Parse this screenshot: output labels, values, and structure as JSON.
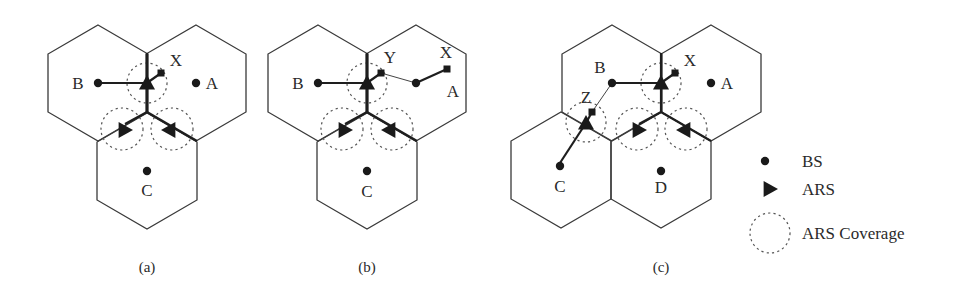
{
  "figure": {
    "panels": [
      {
        "id": "a",
        "caption": "(a)",
        "cells": [
          {
            "name": "B",
            "cx": 98,
            "cy": 83,
            "label_dx": -20,
            "label_dy": 6
          },
          {
            "name": "A",
            "cx": 196,
            "cy": 83,
            "label_dx": 16,
            "label_dy": 6
          },
          {
            "name": "C",
            "cx": 147,
            "cy": 171,
            "label_dx": 0,
            "label_dy": 25
          }
        ],
        "ars": [
          {
            "x": 147,
            "y": 83,
            "dir": "up"
          },
          {
            "x": 125,
            "y": 130,
            "dir": "right"
          },
          {
            "x": 169,
            "y": 130,
            "dir": "left"
          }
        ],
        "coverage": [
          {
            "cx": 147,
            "cy": 83,
            "r": 20
          },
          {
            "cx": 122,
            "cy": 129,
            "r": 21
          },
          {
            "cx": 172,
            "cy": 129,
            "r": 21
          }
        ],
        "mobile_stations": [
          {
            "name": "X",
            "x": 161,
            "y": 73,
            "label_x": 176,
            "label_y": 66
          }
        ],
        "links": [
          {
            "from": [
              98,
              83
            ],
            "to": [
              147,
              83
            ],
            "style": "thick"
          },
          {
            "from": [
              147,
              83
            ],
            "to": [
              161,
              73
            ],
            "style": "thick"
          },
          {
            "from": [
              147,
              53
            ],
            "to": [
              147,
              112
            ],
            "style": "thick"
          },
          {
            "from": [
              147,
              112
            ],
            "to": [
              125,
              124
            ],
            "style": "thick"
          },
          {
            "from": [
              147,
              112
            ],
            "to": [
              197,
              141
            ],
            "style": "thick"
          }
        ]
      },
      {
        "id": "b",
        "caption": "(b)",
        "cells": [
          {
            "name": "B",
            "cx": 318,
            "cy": 83,
            "label_dx": -20,
            "label_dy": 6
          },
          {
            "name": "A",
            "cx": 416,
            "cy": 83,
            "label_dx": 37,
            "label_dy": 14
          },
          {
            "name": "C",
            "cx": 367,
            "cy": 171,
            "label_dx": 0,
            "label_dy": 26
          }
        ],
        "ars": [
          {
            "x": 367,
            "y": 83,
            "dir": "up"
          },
          {
            "x": 345,
            "y": 130,
            "dir": "right"
          },
          {
            "x": 389,
            "y": 130,
            "dir": "left"
          }
        ],
        "coverage": [
          {
            "cx": 367,
            "cy": 83,
            "r": 20
          },
          {
            "cx": 342,
            "cy": 129,
            "r": 21
          },
          {
            "cx": 392,
            "cy": 129,
            "r": 21
          }
        ],
        "mobile_stations": [
          {
            "name": "Y",
            "x": 381,
            "y": 73,
            "label_x": 390,
            "label_y": 63
          },
          {
            "name": "X",
            "x": 447,
            "y": 69,
            "label_x": 446,
            "label_y": 58
          }
        ],
        "links": [
          {
            "from": [
              318,
              83
            ],
            "to": [
              367,
              83
            ],
            "style": "thick"
          },
          {
            "from": [
              367,
              83
            ],
            "to": [
              381,
              73
            ],
            "style": "thick"
          },
          {
            "from": [
              381,
              73
            ],
            "to": [
              416,
              83
            ],
            "style": "thin"
          },
          {
            "from": [
              416,
              83
            ],
            "to": [
              447,
              69
            ],
            "style": "thick"
          },
          {
            "from": [
              367,
              53
            ],
            "to": [
              367,
              112
            ],
            "style": "thick"
          },
          {
            "from": [
              367,
              112
            ],
            "to": [
              345,
              124
            ],
            "style": "thick"
          },
          {
            "from": [
              367,
              112
            ],
            "to": [
              417,
              141
            ],
            "style": "thick"
          }
        ]
      },
      {
        "id": "c",
        "caption": "(c)",
        "cells": [
          {
            "name": "B",
            "cx": 612,
            "cy": 83,
            "label_dx": -12,
            "label_dy": -10
          },
          {
            "name": "A",
            "cx": 711,
            "cy": 83,
            "label_dx": 16,
            "label_dy": 6
          },
          {
            "name": "C",
            "cx": 560,
            "cy": 166,
            "label_dx": 0,
            "label_dy": 26
          },
          {
            "name": "D",
            "cx": 661,
            "cy": 171,
            "label_dx": 0,
            "label_dy": 22
          }
        ],
        "hex_centers": [
          [
            612,
            83
          ],
          [
            711,
            83
          ],
          [
            561,
            170
          ],
          [
            661,
            170
          ]
        ],
        "ars": [
          {
            "x": 661,
            "y": 83,
            "dir": "up"
          },
          {
            "x": 586,
            "y": 123,
            "dir": "up"
          },
          {
            "x": 639,
            "y": 130,
            "dir": "right"
          },
          {
            "x": 684,
            "y": 130,
            "dir": "left"
          }
        ],
        "coverage": [
          {
            "cx": 661,
            "cy": 83,
            "r": 20
          },
          {
            "cx": 586,
            "cy": 122,
            "r": 20
          },
          {
            "cx": 637,
            "cy": 129,
            "r": 21
          },
          {
            "cx": 686,
            "cy": 129,
            "r": 21
          }
        ],
        "mobile_stations": [
          {
            "name": "X",
            "x": 675,
            "y": 73,
            "label_x": 690,
            "label_y": 66
          },
          {
            "name": "Z",
            "x": 592,
            "y": 112,
            "label_x": 586,
            "label_y": 103
          }
        ],
        "links": [
          {
            "from": [
              612,
              83
            ],
            "to": [
              661,
              83
            ],
            "style": "thick"
          },
          {
            "from": [
              661,
              83
            ],
            "to": [
              675,
              73
            ],
            "style": "thick"
          },
          {
            "from": [
              612,
              83
            ],
            "to": [
              592,
              112
            ],
            "style": "thin"
          },
          {
            "from": [
              592,
              112
            ],
            "to": [
              586,
              123
            ],
            "style": "thick"
          },
          {
            "from": [
              586,
              123
            ],
            "to": [
              558,
              166
            ],
            "style": "thick"
          },
          {
            "from": [
              661,
              53
            ],
            "to": [
              661,
              112
            ],
            "style": "thick"
          },
          {
            "from": [
              661,
              112
            ],
            "to": [
              639,
              124
            ],
            "style": "thick"
          },
          {
            "from": [
              661,
              112
            ],
            "to": [
              711,
              141
            ],
            "style": "thick"
          }
        ]
      }
    ],
    "captions": [
      {
        "text": "(a)",
        "x": 147,
        "y": 272
      },
      {
        "text": "(b)",
        "x": 367,
        "y": 272
      },
      {
        "text": "(c)",
        "x": 661,
        "y": 272
      }
    ],
    "legend": {
      "items": [
        {
          "symbol": "dot",
          "label": "BS",
          "sx": 765,
          "sy": 161,
          "lx": 802,
          "ly": 167
        },
        {
          "symbol": "triangle",
          "label": "ARS",
          "sx": 770,
          "sy": 189,
          "lx": 802,
          "ly": 195
        },
        {
          "symbol": "dashed-circle",
          "label": "ARS Coverage",
          "sx": 770,
          "sy": 233,
          "lx": 802,
          "ly": 239
        }
      ]
    },
    "colors": {
      "stroke": "#3a3a3a",
      "fill": "#1a1a1a",
      "background": "#ffffff"
    }
  }
}
